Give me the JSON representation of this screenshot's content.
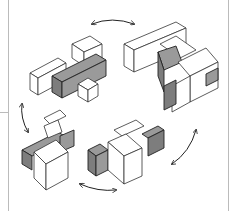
{
  "figure": {
    "colors": {
      "background": "#ffffff",
      "outline": "#333333",
      "shaded_block": "#9a9a9a",
      "border": "#bbbbbb"
    },
    "groups": [
      {
        "position": "top-left",
        "label": ""
      },
      {
        "position": "top-right",
        "label": ""
      },
      {
        "position": "bottom-left",
        "label": ""
      },
      {
        "position": "bottom-right",
        "label": ""
      }
    ],
    "arrows": [
      {
        "position": "top",
        "type": "double-headed-curved"
      },
      {
        "position": "left",
        "type": "double-headed-curved"
      },
      {
        "position": "bottom",
        "type": "double-headed-curved"
      },
      {
        "position": "right",
        "type": "double-headed-curved"
      }
    ]
  }
}
